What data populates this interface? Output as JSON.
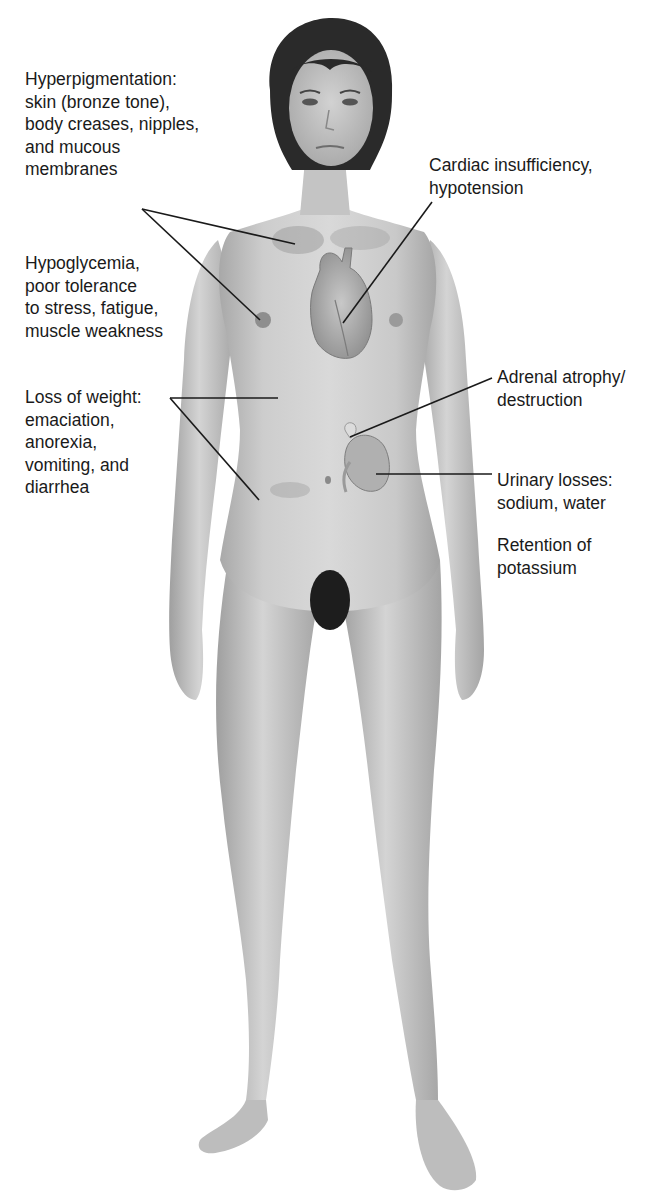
{
  "diagram": {
    "colors": {
      "background": "#ffffff",
      "text": "#1a1a1a",
      "leader_line": "#1a1a1a",
      "skin": "#cfcfcf",
      "skin_shadow": "#a9a9a9",
      "hair": "#2a2a2a",
      "pigment": "#9a9a9a",
      "organ": "#b5b5b5"
    },
    "labels": {
      "hyperpigmentation": {
        "lines": [
          "Hyperpigmentation:",
          "skin (bronze tone),",
          "body creases, nipples,",
          "and mucous",
          "membranes"
        ],
        "x": 25,
        "y": 68
      },
      "cardiac": {
        "lines": [
          "Cardiac insufficiency,",
          "hypotension"
        ],
        "x": 429,
        "y": 154
      },
      "hypoglycemia": {
        "lines": [
          "Hypoglycemia,",
          "poor tolerance",
          "to stress, fatigue,",
          "muscle weakness"
        ],
        "x": 25,
        "y": 252
      },
      "weight_loss": {
        "lines": [
          "Loss of weight:",
          "emaciation,",
          "anorexia,",
          "vomiting, and",
          "diarrhea"
        ],
        "x": 25,
        "y": 386
      },
      "adrenal": {
        "lines": [
          "Adrenal atrophy/",
          "destruction"
        ],
        "x": 497,
        "y": 366
      },
      "urinary": {
        "lines": [
          "Urinary losses:",
          "sodium, water"
        ],
        "x": 497,
        "y": 469
      },
      "potassium": {
        "lines": [
          "Retention of",
          "potassium"
        ],
        "x": 497,
        "y": 534
      }
    },
    "leader_lines": [
      {
        "name": "hyperpigmentation-to-chest",
        "x1": 142,
        "y1": 209,
        "x2": 295,
        "y2": 244
      },
      {
        "name": "hyperpigmentation-to-nipple",
        "x1": 142,
        "y1": 209,
        "x2": 260,
        "y2": 320
      },
      {
        "name": "cardiac-to-heart",
        "x1": 432,
        "y1": 202,
        "x2": 343,
        "y2": 323
      },
      {
        "name": "weight-to-waist",
        "x1": 170,
        "y1": 398,
        "x2": 278,
        "y2": 398
      },
      {
        "name": "weight-to-abdomen",
        "x1": 170,
        "y1": 398,
        "x2": 259,
        "y2": 500
      },
      {
        "name": "adrenal-to-gland",
        "x1": 492,
        "y1": 378,
        "x2": 350,
        "y2": 437
      },
      {
        "name": "urinary-to-kidney",
        "x1": 492,
        "y1": 474,
        "x2": 376,
        "y2": 474
      }
    ]
  }
}
